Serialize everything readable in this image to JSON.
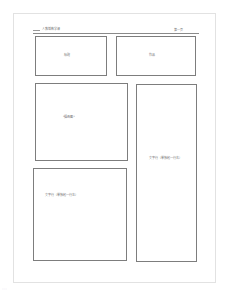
{
  "page": {
    "header": {
      "left_text": "人教版数学课",
      "right_text": "第一页"
    },
    "boxes": [
      {
        "id": "title-box",
        "label": "标题"
      },
      {
        "id": "work-box",
        "label": "作品"
      },
      {
        "id": "illustration-box",
        "label": "\"插画图\""
      },
      {
        "id": "text-right-box",
        "label": "文字行（单独起一行右）"
      },
      {
        "id": "text-left-box",
        "label": "文字行（单独起一行左）"
      }
    ],
    "footer_mark": "·:·:·"
  },
  "colors": {
    "border": "#7d7d7d",
    "page_border": "#e2e2e2",
    "text": "#6f6f6f",
    "background": "#ffffff"
  }
}
